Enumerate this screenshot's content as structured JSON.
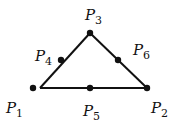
{
  "diagram": {
    "type": "triangle-with-midpoints",
    "colors": {
      "stroke": "#111111",
      "background": "#ffffff"
    },
    "points": [
      {
        "id": "P1",
        "letter": "P",
        "index": "1",
        "x": 33,
        "y": 88,
        "label_x": 6,
        "label_y": 101
      },
      {
        "id": "P2",
        "letter": "P",
        "index": "2",
        "x": 147,
        "y": 88,
        "label_x": 151,
        "label_y": 101
      },
      {
        "id": "P3",
        "letter": "P",
        "index": "3",
        "x": 90,
        "y": 33,
        "label_x": 85,
        "label_y": 8
      },
      {
        "id": "P4",
        "letter": "P",
        "index": "4",
        "x": 61,
        "y": 60,
        "label_x": 35,
        "label_y": 49
      },
      {
        "id": "P5",
        "letter": "P",
        "index": "5",
        "x": 90,
        "y": 88,
        "label_x": 83,
        "label_y": 104
      },
      {
        "id": "P6",
        "letter": "P",
        "index": "6",
        "x": 118,
        "y": 60,
        "label_x": 133,
        "label_y": 43
      }
    ],
    "edges": [
      {
        "from": "P1",
        "to": "P2"
      },
      {
        "from": "P2",
        "to": "P3"
      },
      {
        "from": "P3",
        "to": "P1"
      }
    ]
  }
}
